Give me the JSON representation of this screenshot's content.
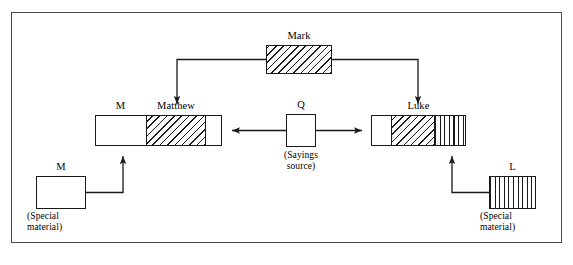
{
  "diagram": {
    "frame": {
      "border_color": "#4a4a4a"
    },
    "nodes": [
      {
        "id": "mark",
        "label": "Mark",
        "label_position": "above",
        "caption": "",
        "fill": "diagonal-hatch",
        "x": 266,
        "y": 45,
        "w": 66,
        "h": 29,
        "segments": [
          {
            "pattern": "diag",
            "width_pct": 100
          }
        ]
      },
      {
        "id": "matthew",
        "label": "Matthew",
        "label_position": "above",
        "label_secondary": "M",
        "caption": "",
        "x": 95,
        "y": 115,
        "w": 127,
        "h": 31,
        "segments": [
          {
            "pattern": "plain",
            "width_pct": 40
          },
          {
            "pattern": "diag",
            "width_pct": 47
          },
          {
            "pattern": "plain",
            "width_pct": 13
          }
        ]
      },
      {
        "id": "q",
        "label": "Q",
        "label_position": "above",
        "caption": "(Sayings source)",
        "caption_lines": [
          "(Sayings",
          "source)"
        ],
        "x": 286,
        "y": 114,
        "w": 30,
        "h": 33,
        "segments": [
          {
            "pattern": "plain",
            "width_pct": 100
          }
        ]
      },
      {
        "id": "luke",
        "label": "Luke",
        "label_position": "above",
        "caption": "",
        "x": 371,
        "y": 115,
        "w": 95,
        "h": 31,
        "segments": [
          {
            "pattern": "plain",
            "width_pct": 20
          },
          {
            "pattern": "diag",
            "width_pct": 47
          },
          {
            "pattern": "vert",
            "width_pct": 33
          }
        ]
      },
      {
        "id": "m-special",
        "label": "M",
        "label_position": "above",
        "caption_lines": [
          "(Special",
          "material)"
        ],
        "x": 36,
        "y": 176,
        "w": 50,
        "h": 33,
        "segments": [
          {
            "pattern": "plain",
            "width_pct": 100
          }
        ]
      },
      {
        "id": "l-special",
        "label": "L",
        "label_position": "above",
        "caption_lines": [
          "(Special",
          "material)"
        ],
        "x": 489,
        "y": 176,
        "w": 47,
        "h": 33,
        "segments": [
          {
            "pattern": "vert",
            "width_pct": 100
          }
        ]
      }
    ],
    "connections": [
      {
        "id": "mark-to-matthew",
        "from": "mark",
        "to": "matthew",
        "arrow": "single"
      },
      {
        "id": "mark-to-luke",
        "from": "mark",
        "to": "luke",
        "arrow": "single"
      },
      {
        "id": "q-to-matthew",
        "from": "q",
        "to": "matthew",
        "arrow": "single"
      },
      {
        "id": "q-to-luke",
        "from": "q",
        "to": "luke",
        "arrow": "single"
      },
      {
        "id": "m-special-to-matthew",
        "from": "m-special",
        "to": "matthew",
        "arrow": "single"
      },
      {
        "id": "l-special-to-luke",
        "from": "l-special",
        "to": "luke",
        "arrow": "single"
      }
    ]
  }
}
